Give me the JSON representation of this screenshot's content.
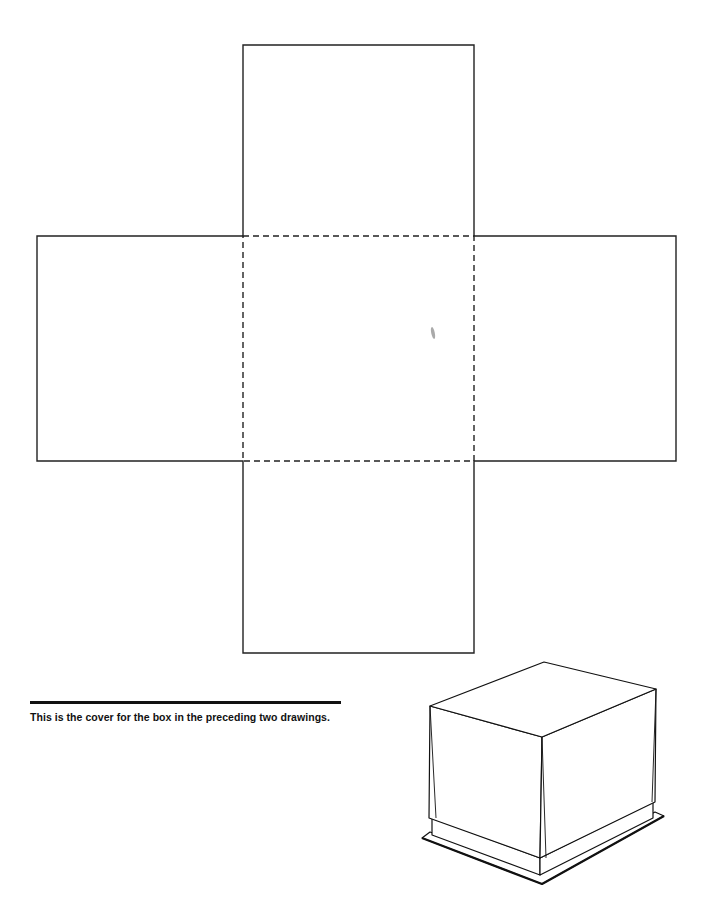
{
  "diagram": {
    "net": {
      "center_panel": {
        "x": 243,
        "y": 236,
        "w": 231,
        "h": 225,
        "fold_lines": "dashed"
      },
      "top_flap": {
        "x": 243,
        "y": 45,
        "w": 231,
        "h": 191
      },
      "bottom_flap": {
        "x": 243,
        "y": 461,
        "w": 231,
        "h": 192
      },
      "left_flap": {
        "x": 37,
        "y": 236,
        "w": 206,
        "h": 225
      },
      "right_flap": {
        "x": 474,
        "y": 236,
        "w": 202,
        "h": 225
      }
    },
    "illustration": "Assembled box with cover placed on top, shown in isometric view on a base plate"
  },
  "caption": {
    "text": "This is the cover for the box in the preceding two drawings."
  },
  "colors": {
    "line": "#222222",
    "background": "#ffffff"
  }
}
